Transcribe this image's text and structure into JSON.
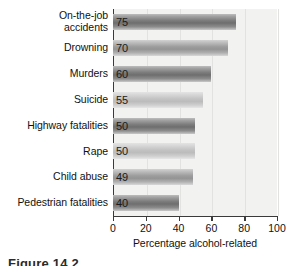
{
  "chart_data": {
    "type": "bar",
    "orientation": "horizontal",
    "title": "",
    "xlabel": "Percentage alcohol-related",
    "ylabel": "",
    "xlim": [
      0,
      100
    ],
    "xticks": [
      0,
      20,
      40,
      60,
      80,
      100
    ],
    "grid": true,
    "grid_axis": "x",
    "legend": "none",
    "categories": [
      "On-the-job accidents",
      "Drowning",
      "Murders",
      "Suicide",
      "Highway fatalities",
      "Rape",
      "Child abuse",
      "Pedestrian fatalities"
    ],
    "values": [
      75,
      70,
      60,
      55,
      50,
      50,
      49,
      40
    ],
    "value_labels": [
      "75",
      "70",
      "60",
      "55",
      "50",
      "50",
      "49",
      "40"
    ],
    "bars": [
      {
        "label": "On-the-job accidents",
        "label_lines": [
          "On-the-job",
          "accidents"
        ],
        "value": 75,
        "value_text": "75",
        "shade": "dark"
      },
      {
        "label": "Drowning",
        "label_lines": [
          "Drowning"
        ],
        "value": 70,
        "value_text": "70",
        "shade": "mid"
      },
      {
        "label": "Murders",
        "label_lines": [
          "Murders"
        ],
        "value": 60,
        "value_text": "60",
        "shade": "dark"
      },
      {
        "label": "Suicide",
        "label_lines": [
          "Suicide"
        ],
        "value": 55,
        "value_text": "55",
        "shade": "light"
      },
      {
        "label": "Highway fatalities",
        "label_lines": [
          "Highway fatalities"
        ],
        "value": 50,
        "value_text": "50",
        "shade": "dark"
      },
      {
        "label": "Rape",
        "label_lines": [
          "Rape"
        ],
        "value": 50,
        "value_text": "50",
        "shade": "light"
      },
      {
        "label": "Child abuse",
        "label_lines": [
          "Child abuse"
        ],
        "value": 49,
        "value_text": "49",
        "shade": "mid"
      },
      {
        "label": "Pedestrian fatalities",
        "label_lines": [
          "Pedestrian fatalities"
        ],
        "value": 40,
        "value_text": "40",
        "shade": "dark"
      }
    ],
    "colors": {
      "plot_background": "#f2f2f1",
      "gridline": "#e2e2e0",
      "axis": "#3a3a3a",
      "text": "#111111",
      "bar_dark": "#7d7d7d",
      "bar_mid": "#9d9d9d",
      "bar_light": "#c2c2c2"
    }
  },
  "axis": {
    "tick_labels": [
      "0",
      "20",
      "40",
      "60",
      "80",
      "100"
    ],
    "title": "Percentage alcohol-related"
  },
  "caption": {
    "text": "Figure 14.2"
  }
}
